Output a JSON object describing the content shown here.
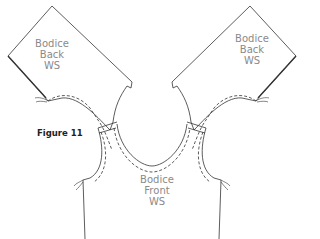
{
  "figure": {
    "caption": "Figure 11",
    "pieces": [
      {
        "name": "left-back",
        "lines": [
          "Bodice",
          "Back",
          "WS"
        ]
      },
      {
        "name": "right-back",
        "lines": [
          "Bodice",
          "Back",
          "WS"
        ]
      },
      {
        "name": "front",
        "lines": [
          "Bodice",
          "Front",
          "WS"
        ]
      }
    ],
    "colors": {
      "line": "#333333",
      "label": "#8a8a8a",
      "caption": "#222222"
    }
  }
}
